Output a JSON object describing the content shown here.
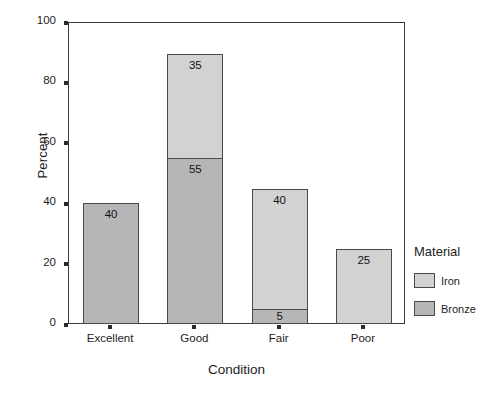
{
  "chart_data": {
    "type": "bar",
    "subtype": "stacked-bar",
    "title": "",
    "xlabel": "Condition",
    "ylabel": "Percent",
    "categories": [
      "Excellent",
      "Good",
      "Fair",
      "Poor"
    ],
    "series": [
      {
        "name": "Iron",
        "color": "#d2d2d2",
        "values": [
          0,
          35,
          40,
          25
        ]
      },
      {
        "name": "Bronze",
        "color": "#b6b6b6",
        "values": [
          40,
          55,
          5,
          0
        ]
      }
    ],
    "stack_order_bottom_to_top": [
      "Bronze",
      "Iron"
    ],
    "bar_totals": [
      40,
      90,
      45,
      25
    ],
    "data_labels": {
      "Excellent": {
        "Bronze": "40"
      },
      "Good": {
        "Bronze": "55",
        "Iron": "35"
      },
      "Fair": {
        "Bronze": "5",
        "Iron": "40"
      },
      "Poor": {
        "Iron": "25"
      }
    },
    "ylim": [
      0,
      100
    ],
    "yticks": [
      0,
      20,
      40,
      60,
      80,
      100
    ],
    "ytick_labels": [
      "0",
      "20",
      "40",
      "60",
      "80",
      "100"
    ],
    "grid": false,
    "legend_position": "right",
    "legend_title": "Material",
    "legend_entries": [
      "Iron",
      "Bronze"
    ],
    "frame": true,
    "background_color": "#ffffff",
    "axis_color": "#3a3a3a",
    "bar_border_color": "#4a4a4a"
  },
  "axes": {
    "y_title": "Percent",
    "x_title": "Condition"
  },
  "legend": {
    "title": "Material",
    "items": [
      {
        "label": "Iron",
        "color": "#d2d2d2"
      },
      {
        "label": "Bronze",
        "color": "#b6b6b6"
      }
    ]
  },
  "yticks": [
    {
      "label": "100"
    },
    {
      "label": "80"
    },
    {
      "label": "60"
    },
    {
      "label": "40"
    },
    {
      "label": "20"
    },
    {
      "label": "0"
    }
  ],
  "bars": [
    {
      "category": "Excellent",
      "segments": [
        {
          "series": "Iron",
          "value": 0,
          "label": ""
        },
        {
          "series": "Bronze",
          "value": 40,
          "label": "40"
        }
      ]
    },
    {
      "category": "Good",
      "segments": [
        {
          "series": "Iron",
          "value": 35,
          "label": "35"
        },
        {
          "series": "Bronze",
          "value": 55,
          "label": "55"
        }
      ]
    },
    {
      "category": "Fair",
      "segments": [
        {
          "series": "Iron",
          "value": 40,
          "label": "40"
        },
        {
          "series": "Bronze",
          "value": 5,
          "label": "5"
        }
      ]
    },
    {
      "category": "Poor",
      "segments": [
        {
          "series": "Iron",
          "value": 25,
          "label": "25"
        },
        {
          "series": "Bronze",
          "value": 0,
          "label": ""
        }
      ]
    }
  ]
}
